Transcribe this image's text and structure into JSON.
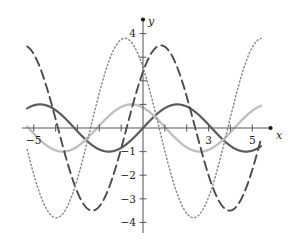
{
  "figure": {
    "title": "",
    "background_color": "#ffffff"
  },
  "axes": {
    "x_axis_label": "x",
    "y_axis_label": "y",
    "x_ticks_labeled": [
      "-5",
      "3",
      "5"
    ],
    "y_ticks_labeled": [
      "4",
      "-1",
      "-2",
      "-3",
      "-4"
    ],
    "axis_color": "#595959"
  },
  "chart_data": {
    "type": "line",
    "title": "",
    "xlabel": "x",
    "ylabel": "y",
    "xlim": [
      -5.6,
      5.8
    ],
    "ylim": [
      -4.5,
      4.4
    ],
    "grid": false,
    "legend": "none",
    "x_tick_values": [
      -5,
      -4,
      -3,
      -2,
      -1,
      1,
      2,
      3,
      4,
      5
    ],
    "x_tick_labels_shown": {
      "-5": "-5",
      "3": "3",
      "5": "5"
    },
    "y_tick_values": [
      4,
      3,
      2,
      1,
      -1,
      -2,
      -3,
      -4
    ],
    "y_tick_labels_shown": {
      "4": "4",
      "-1": "-1",
      "-2": "-2",
      "-3": "-3",
      "-4": "-4"
    },
    "x_domain_plotted": [
      -5.3,
      5.4
    ],
    "samples": 540,
    "series": [
      {
        "name": "dark-solid-sine",
        "style": "solid",
        "color": "#5a5a60",
        "width": 2.2,
        "amplitude": 1.0,
        "frequency": 1.0,
        "phase": 0.0,
        "offset": 0.0,
        "formula": "y = sin(x)",
        "description": "thick dark gray solid sine wave, amplitude 1, rising through the origin",
        "maxima": [
          {
            "x": 1.57,
            "y": 1.0
          },
          {
            "x": -4.71,
            "y": 1.0
          }
        ],
        "minima": [
          {
            "x": -1.57,
            "y": -1.0
          },
          {
            "x": 4.71,
            "y": -1.0
          }
        ]
      },
      {
        "name": "light-solid-cosine-shift",
        "style": "solid",
        "color": "#c0c0c0",
        "width": 2.4,
        "amplitude": 1.0,
        "frequency": 1.0,
        "phase": 2.1,
        "offset": 0.0,
        "formula": "y = sin(x + 2.1)",
        "description": "light gray solid wave, amplitude 1, shifted left relative to the dark sine",
        "maxima": [
          {
            "x": -0.53,
            "y": 1.0
          },
          {
            "x": 5.76,
            "y": 1.0
          }
        ],
        "minima": [
          {
            "x": -3.67,
            "y": -1.0
          },
          {
            "x": 2.61,
            "y": -1.0
          }
        ]
      },
      {
        "name": "long-dashed-large-amplitude",
        "style": "dashed",
        "color": "#4a4a50",
        "width": 1.9,
        "amplitude": 3.5,
        "frequency": 1.0,
        "phase": 0.75,
        "offset": 0.0,
        "formula": "y = 3.5 sin(x + 0.75)",
        "description": "long-dashed dark curve, amplitude 3.5, peak just right of the y-axis",
        "maxima": [
          {
            "x": 0.82,
            "y": 3.5
          },
          {
            "x": -5.46,
            "y": 3.5
          }
        ],
        "minima": [
          {
            "x": -2.32,
            "y": -3.5
          },
          {
            "x": 3.96,
            "y": -3.5
          }
        ]
      },
      {
        "name": "fine-dotted-large-amplitude",
        "style": "dotted",
        "color": "#8a8a8a",
        "width": 1.5,
        "amplitude": 3.8,
        "frequency": 1.0,
        "phase": 2.4,
        "offset": 0.0,
        "formula": "y = 3.8 sin(x + 2.4)",
        "description": "finely dotted gray curve, amplitude 3.8, peak left of the y-axis",
        "maxima": [
          {
            "x": -0.83,
            "y": 3.8
          },
          {
            "x": 5.45,
            "y": 3.8
          }
        ],
        "minima": [
          {
            "x": -3.97,
            "y": -3.8
          },
          {
            "x": 2.31,
            "y": -3.8
          }
        ]
      }
    ]
  }
}
